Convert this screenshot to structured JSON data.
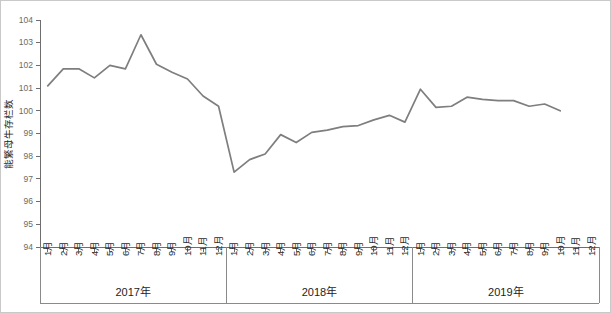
{
  "chart_data": {
    "type": "line",
    "title": "",
    "subtitle": "",
    "xlabel": "",
    "ylabel": "能繁母牛存栏数",
    "ylim": [
      94,
      104
    ],
    "ytick_step": 1,
    "yticks": [
      94,
      95,
      96,
      97,
      98,
      99,
      100,
      101,
      102,
      103,
      104
    ],
    "grid": false,
    "legend": false,
    "legend_position": "none",
    "line_color": "#7e7e7e",
    "axis_color": "#6e6e6e",
    "border_color": "#c9c9c9",
    "month_labels": [
      "1月",
      "2月",
      "3月",
      "4月",
      "5月",
      "6月",
      "7月",
      "8月",
      "9月",
      "10月",
      "11月",
      "12月"
    ],
    "groups": [
      {
        "label": "2017年",
        "months": 12
      },
      {
        "label": "2018年",
        "months": 12
      },
      {
        "label": "2019年",
        "months": 12
      }
    ],
    "categories": [
      "2017年1月",
      "2017年2月",
      "2017年3月",
      "2017年4月",
      "2017年5月",
      "2017年6月",
      "2017年7月",
      "2017年8月",
      "2017年9月",
      "2017年10月",
      "2017年11月",
      "2017年12月",
      "2018年1月",
      "2018年2月",
      "2018年3月",
      "2018年4月",
      "2018年5月",
      "2018年6月",
      "2018年7月",
      "2018年8月",
      "2018年9月",
      "2018年10月",
      "2018年11月",
      "2018年12月",
      "2019年1月",
      "2019年2月",
      "2019年3月",
      "2019年4月",
      "2019年5月",
      "2019年6月",
      "2019年7月",
      "2019年8月",
      "2019年9月",
      "2019年10月",
      "2019年11月",
      "2019年12月"
    ],
    "series": [
      {
        "name": "能繁母牛存栏数",
        "values": [
          101.1,
          101.85,
          101.85,
          101.45,
          102.0,
          101.85,
          103.35,
          102.05,
          101.7,
          101.4,
          100.65,
          100.2,
          97.3,
          97.85,
          98.1,
          98.95,
          98.6,
          99.05,
          99.15,
          99.3,
          99.35,
          99.6,
          99.8,
          99.5,
          100.95,
          100.15,
          100.2,
          100.6,
          100.5,
          100.45,
          100.45,
          100.2,
          100.3,
          100.0,
          null,
          null
        ]
      }
    ]
  }
}
